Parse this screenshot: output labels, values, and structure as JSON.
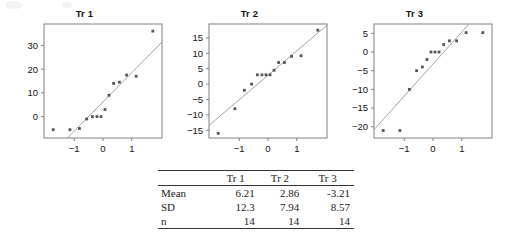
{
  "figure": {
    "type": "qq-plot-panel",
    "panel_count": 3
  },
  "chart_data": [
    {
      "type": "scatter",
      "title": "Tr 1",
      "xlabel": "",
      "ylabel": "",
      "xlim": [
        -2.05,
        2.05
      ],
      "ylim": [
        -9,
        39
      ],
      "xticks": [
        -1,
        0,
        1
      ],
      "yticks": [
        0,
        10,
        20,
        30
      ],
      "grid": false,
      "legend": "none",
      "reference_line": {
        "intercept": 6.21,
        "slope": 12.3
      },
      "x": [
        -1.73,
        -1.15,
        -0.82,
        -0.57,
        -0.37,
        -0.21,
        -0.07,
        0.07,
        0.21,
        0.37,
        0.57,
        0.82,
        1.15,
        1.73
      ],
      "y": [
        -5.5,
        -5.5,
        -5.0,
        -1.0,
        0.0,
        0.0,
        0.0,
        3.0,
        9.0,
        14.0,
        14.5,
        17.5,
        17.0,
        36.0
      ]
    },
    {
      "type": "scatter",
      "title": "Tr 2",
      "xlabel": "",
      "ylabel": "",
      "xlim": [
        -2.05,
        2.05
      ],
      "ylim": [
        -17.5,
        19.5
      ],
      "xticks": [
        -1,
        0,
        1
      ],
      "yticks": [
        -15,
        -10,
        -5,
        0,
        5,
        10,
        15
      ],
      "grid": false,
      "legend": "none",
      "reference_line": {
        "intercept": 2.86,
        "slope": 7.94
      },
      "x": [
        -1.73,
        -1.15,
        -0.82,
        -0.57,
        -0.37,
        -0.21,
        -0.07,
        0.07,
        0.21,
        0.37,
        0.57,
        0.82,
        1.15,
        1.73
      ],
      "y": [
        -16.0,
        -8.0,
        -2.0,
        0.0,
        3.0,
        3.0,
        3.0,
        3.0,
        4.5,
        7.0,
        7.0,
        9.0,
        9.2,
        17.5
      ]
    },
    {
      "type": "scatter",
      "title": "Tr 3",
      "xlabel": "",
      "ylabel": "",
      "xlim": [
        -2.05,
        2.05
      ],
      "ylim": [
        -23,
        7.5
      ],
      "xticks": [
        -1,
        0,
        1
      ],
      "yticks": [
        -20,
        -15,
        -10,
        -5,
        0,
        5
      ],
      "grid": false,
      "legend": "none",
      "reference_line": {
        "intercept": -3.21,
        "slope": 8.57
      },
      "x": [
        -1.73,
        -1.15,
        -0.82,
        -0.57,
        -0.37,
        -0.21,
        -0.07,
        0.07,
        0.21,
        0.37,
        0.57,
        0.82,
        1.15,
        1.73
      ],
      "y": [
        -21.0,
        -21.0,
        -10.0,
        -5.0,
        -4.0,
        -2.0,
        0.0,
        0.0,
        0.0,
        2.0,
        3.0,
        3.0,
        5.2,
        5.2
      ]
    }
  ],
  "table": {
    "corner": "",
    "columns": [
      "Tr 1",
      "Tr 2",
      "Tr 3"
    ],
    "rows": [
      {
        "label": "Mean",
        "values": [
          "6.21",
          "2.86",
          "-3.21"
        ]
      },
      {
        "label": "SD",
        "values": [
          "12.3",
          "7.94",
          "8.57"
        ]
      },
      {
        "label": "n",
        "values": [
          "14",
          "14",
          "14"
        ]
      }
    ]
  },
  "style": {
    "axis_color": "#808080",
    "point_color": "#555555",
    "line_color": "#999999",
    "rule_color": "#333333"
  }
}
